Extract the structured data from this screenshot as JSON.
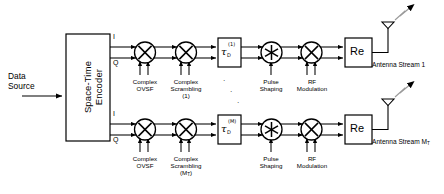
{
  "diagram": {
    "source": {
      "line1": "Data",
      "line2": "Source"
    },
    "encoder": {
      "line1": "Space-Time",
      "line2": "Encoder"
    },
    "port_labels": {
      "i": "I",
      "q": "Q"
    },
    "vertical_dots": "·",
    "chains": [
      {
        "id": "chain-1",
        "ovsf": {
          "line1": "Complex",
          "line2": "OVSF"
        },
        "scrambling": {
          "line1": "Complex",
          "line2": "Scrambling",
          "line3": "(1)"
        },
        "delay": {
          "symbol": "τ",
          "sub": "D",
          "sup": "(1)"
        },
        "pulse": {
          "line1": "Pulse",
          "line2": "Shaping"
        },
        "rf": {
          "line1": "RF",
          "line2": "Modulation"
        },
        "real": "Re",
        "antenna_label": "Antenna Stream 1",
        "antenna_label_sub": ""
      },
      {
        "id": "chain-2",
        "ovsf": {
          "line1": "Complex",
          "line2": "OVSF"
        },
        "scrambling": {
          "line1": "Complex",
          "line2": "Scrambling",
          "line3": "(M",
          "line3_sub": "T",
          "line3_end": ")"
        },
        "delay": {
          "symbol": "τ",
          "sub": "D",
          "sup": "(M)"
        },
        "pulse": {
          "line1": "Pulse",
          "line2": "Shaping"
        },
        "rf": {
          "line1": "RF",
          "line2": "Modulation"
        },
        "real": "Re",
        "antenna_label": "Antenna Stream M",
        "antenna_label_sub": "T"
      }
    ],
    "icons": {
      "multiplier": "multiply-circle-icon",
      "convolution": "asterisk-circle-icon",
      "antenna": "antenna-icon",
      "radiation": "radiation-arrow-icon"
    },
    "colors": {
      "line": "#000000",
      "fill": "#ffffff",
      "radiation": "#808080"
    }
  }
}
